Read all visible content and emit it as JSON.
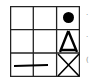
{
  "diagram": {
    "type": "grid-puzzle",
    "rows": 3,
    "cols": 3,
    "cells": [
      [
        "empty",
        "empty",
        "filled-circle"
      ],
      [
        "empty",
        "empty",
        "triangle-outline"
      ],
      [
        "horizontal-line",
        "empty",
        "x-cross"
      ]
    ],
    "line_color": "#222222",
    "shape_color": "#000000"
  },
  "side_marks": [
    {
      "row": 0,
      "glyph": "·"
    },
    {
      "row": 1,
      "glyph": "·"
    },
    {
      "row": 2,
      "glyph": "("
    }
  ]
}
